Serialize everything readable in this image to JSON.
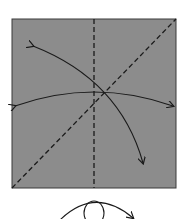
{
  "diagram": {
    "type": "origami-fold-diagram",
    "paper": {
      "x": 12,
      "y": 19,
      "width": 164,
      "height": 169,
      "color": "#8c8c8c",
      "border": "#3a3a3a"
    },
    "lines": [
      {
        "name": "vertical-valley-fold-line",
        "style": "dashed",
        "x1": 94,
        "y1": 19,
        "x2": 94,
        "y2": 188
      },
      {
        "name": "diagonal-valley-fold-line",
        "style": "dashed",
        "x1": 12,
        "y1": 188,
        "x2": 176,
        "y2": 19
      }
    ],
    "arrows": [
      {
        "name": "horizontal-fold-arrow",
        "description": "double-headed curved arrow left to right"
      },
      {
        "name": "diagonal-fold-arrow",
        "description": "double-headed curved arrow upper-left to lower-right"
      }
    ],
    "symbol": {
      "name": "turn-over-symbol",
      "description": "loop arrow indicating turn paper over"
    },
    "colors": {
      "paper": "#8c8c8c",
      "line": "#1a1a1a",
      "background": "#ffffff"
    }
  }
}
